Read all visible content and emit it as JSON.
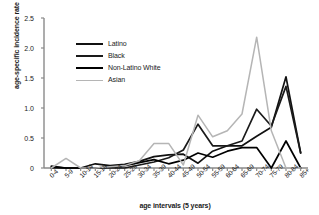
{
  "chart_data": {
    "type": "line",
    "title": "",
    "xlabel": "age intervals (5 years)",
    "ylabel": "age-specific incidence rate",
    "categories": [
      "0-4",
      "5-9",
      "10-14",
      "15-19",
      "20-24",
      "25-29",
      "30-34",
      "35-39",
      "40-44",
      "45-49",
      "50-54",
      "55-59",
      "60-64",
      "65-69",
      "70-74",
      "75-79",
      "80-84",
      "85+"
    ],
    "ylim": [
      0,
      2.5
    ],
    "yticks": [
      "0",
      "0.5",
      "1.0",
      "1.5",
      "2.0",
      "2.5"
    ],
    "ytick_values": [
      0,
      0.5,
      1.0,
      1.5,
      2.0,
      2.5
    ],
    "grid": false,
    "legend_position": "upper-left-inside",
    "series": [
      {
        "name": "Latino",
        "color": "#111111",
        "values": [
          0.03,
          0.0,
          0.0,
          0.07,
          0.04,
          0.06,
          0.11,
          0.19,
          0.22,
          0.23,
          0.08,
          0.28,
          0.37,
          0.37,
          0.53,
          0.68,
          1.52,
          0.25
        ]
      },
      {
        "name": "Black",
        "color": "#1a1a1a",
        "values": [
          0.0,
          0.0,
          0.0,
          0.0,
          0.0,
          0.0,
          0.05,
          0.1,
          0.17,
          0.3,
          0.73,
          0.37,
          0.37,
          0.45,
          0.98,
          0.7,
          1.36,
          0.25
        ]
      },
      {
        "name": "Non-Latino White",
        "color": "#000000",
        "values": [
          0.02,
          0.0,
          0.0,
          0.0,
          0.02,
          0.04,
          0.09,
          0.14,
          0.07,
          0.13,
          0.25,
          0.18,
          0.28,
          0.34,
          0.34,
          0.0,
          0.45,
          0.0
        ]
      },
      {
        "name": "Asian",
        "color": "#b5b5b5",
        "values": [
          0.0,
          0.16,
          0.0,
          0.0,
          0.02,
          0.04,
          0.12,
          0.41,
          0.41,
          0.05,
          0.88,
          0.52,
          0.62,
          0.9,
          2.18,
          0.62,
          0.0,
          0.0
        ]
      }
    ]
  },
  "legend": {
    "items": [
      {
        "label": "Latino"
      },
      {
        "label": "Black"
      },
      {
        "label": "Non-Latino White"
      },
      {
        "label": "Asian"
      }
    ]
  }
}
